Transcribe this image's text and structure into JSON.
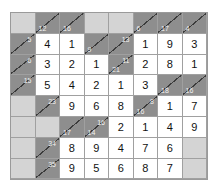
{
  "puzzle": {
    "type": "kakuro",
    "rows": 8,
    "cols": 8,
    "colors": {
      "clue_bg": "#8e8e8e",
      "blank_bg": "#d4d4d4",
      "cell_bg": "#ffffff",
      "clue_text": "#f2f2f2"
    },
    "cells": [
      [
        {
          "t": "blank"
        },
        {
          "t": "clue",
          "down": "12"
        },
        {
          "t": "clue",
          "down": "16"
        },
        {
          "t": "blank"
        },
        {
          "t": "blank"
        },
        {
          "t": "clue",
          "down": "6"
        },
        {
          "t": "clue",
          "down": "17"
        },
        {
          "t": "clue",
          "down": "4"
        }
      ],
      [
        {
          "t": "clue",
          "right": "5"
        },
        {
          "t": "val",
          "v": "4"
        },
        {
          "t": "val",
          "v": "1"
        },
        {
          "t": "clue",
          "down": "9"
        },
        {
          "t": "clue",
          "right": "13"
        },
        {
          "t": "val",
          "v": "1"
        },
        {
          "t": "val",
          "v": "9"
        },
        {
          "t": "val",
          "v": "3"
        }
      ],
      [
        {
          "t": "clue",
          "right": "6"
        },
        {
          "t": "val",
          "v": "3"
        },
        {
          "t": "val",
          "v": "2"
        },
        {
          "t": "val",
          "v": "1"
        },
        {
          "t": "clue",
          "down": "21",
          "right": "11"
        },
        {
          "t": "val",
          "v": "2"
        },
        {
          "t": "val",
          "v": "8"
        },
        {
          "t": "val",
          "v": "1"
        }
      ],
      [
        {
          "t": "clue",
          "right": "15"
        },
        {
          "t": "val",
          "v": "5"
        },
        {
          "t": "val",
          "v": "4"
        },
        {
          "t": "val",
          "v": "2"
        },
        {
          "t": "val",
          "v": "1"
        },
        {
          "t": "val",
          "v": "3"
        },
        {
          "t": "clue",
          "down": "18"
        },
        {
          "t": "clue",
          "down": "16"
        }
      ],
      [
        {
          "t": "blank"
        },
        {
          "t": "clue",
          "right": "23"
        },
        {
          "t": "val",
          "v": "9"
        },
        {
          "t": "val",
          "v": "6"
        },
        {
          "t": "val",
          "v": "8"
        },
        {
          "t": "clue",
          "down": "16",
          "right": "8"
        },
        {
          "t": "val",
          "v": "1"
        },
        {
          "t": "val",
          "v": "7"
        }
      ],
      [
        {
          "t": "blank"
        },
        {
          "t": "blank"
        },
        {
          "t": "clue",
          "down": "17"
        },
        {
          "t": "clue",
          "down": "14",
          "right": "16"
        },
        {
          "t": "val",
          "v": "2"
        },
        {
          "t": "val",
          "v": "1"
        },
        {
          "t": "val",
          "v": "4"
        },
        {
          "t": "val",
          "v": "9"
        }
      ],
      [
        {
          "t": "blank"
        },
        {
          "t": "clue",
          "right": "34"
        },
        {
          "t": "val",
          "v": "8"
        },
        {
          "t": "val",
          "v": "9"
        },
        {
          "t": "val",
          "v": "4"
        },
        {
          "t": "val",
          "v": "7"
        },
        {
          "t": "val",
          "v": "6"
        },
        {
          "t": "blank"
        }
      ],
      [
        {
          "t": "blank"
        },
        {
          "t": "clue",
          "right": "35"
        },
        {
          "t": "val",
          "v": "9"
        },
        {
          "t": "val",
          "v": "5"
        },
        {
          "t": "val",
          "v": "6"
        },
        {
          "t": "val",
          "v": "8"
        },
        {
          "t": "val",
          "v": "7"
        },
        {
          "t": "blank"
        }
      ]
    ]
  }
}
